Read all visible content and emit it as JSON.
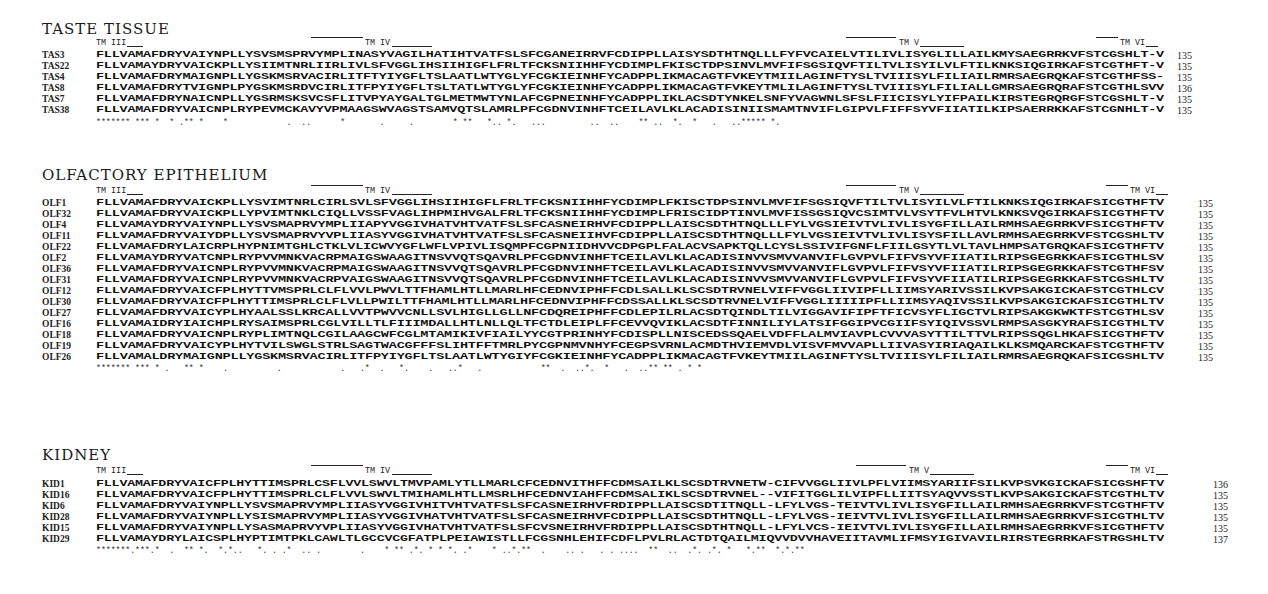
{
  "figure": {
    "sections": [
      {
        "title": "TASTE TISSUE",
        "tm_labels": [
          "TM III",
          "TM IV",
          "TM V",
          "TM VI"
        ],
        "sequences": [
          {
            "name": "TAS3",
            "seq": "FLLVAMAFDRYVAIYNPLLYSVSMSPRVYMPLINASYVAGILHATIHTVATFSLSFCGANEIRRVFCDIPPLLAISYSDTHTNQLLLFYFVCAIELVTILIVLISYGLILLAILKMYSAEGRRKVFSTCGSHLT-V",
            "length": "135"
          },
          {
            "name": "TAS22",
            "seq": "FLLVAMAYDRYVAICKPLLYSIIMTNRLIIRLIVLSFVGGLIHSIIHIGFLFRLTFCKSNIIHHFYCDIMPLFKISCTDPSINVLMVFIFSGSIQVFTILTVLISYILVLFTILKNKSIQGIRKAFSTCGTHFT-V",
            "length": "135"
          },
          {
            "name": "TAS4",
            "seq": "FLLVAMAFDRYMAIGNPLLYGSKMSRVACIRLITFTYIYGFLTSLAATLWTYGLYFCGKIEINHFYCADPPLIKMACAGTFVKEYTMIILAGINFTYSLTVIIISYLFILIAILRMRSAEGRQKAFSTCGTHFSS-",
            "length": "135"
          },
          {
            "name": "TAS8",
            "seq": "FLLVAMAFDRYTVIGNPLPYGSKMSRDVCIRLITFPYIYGFLTSLTATLWTYGLYFCGKIEINHFYCADPPLIKMACAGTFVKEYTMLILAGINFTYSLTVIIISYLFILIALLGMRSAEGRQRAFSTCGTHLSVV",
            "length": "136"
          },
          {
            "name": "TAS7",
            "seq": "FLLVAMAFDRYNAICNPLLYGSRMSKSVCSFLITVPYAYGALTGLMETMWTYNLAFCGPNEINHFYCADPPLIKLACSDTYNKELSNFYVAGWNLSFSLFIICISYLYIFPAILKIRSTEGRQRGFSTCGSHLT-V",
            "length": "135"
          },
          {
            "name": "TAS38",
            "seq": "FLLVAMAFDRYVAICNPLRYPEVMCKAVYVPMAAGSWVAGSTSAMVQTSLAMRLPFCGDNVINHFTCEILAVLKLACADISINIISMAMTNVIFLGIPVLFIFFSYVFIIATILKIPSAERRKKAFSTCGNHLT-V",
            "length": "135"
          }
        ],
        "consensus": "******* *** *  * .** *    *            .  ..      *       .     .        * **   *.. *.   ...         ..  ..    ** ..  *.  *   .   ..***** *."
      },
      {
        "title": "OLFACTORY EPITHELIUM",
        "tm_labels": [
          "TM III",
          "TM IV",
          "TM V",
          "TM VI"
        ],
        "sequences": [
          {
            "name": "OLF1",
            "seq": "FLLVAMAFDRYVAICKPLLYSVIMTNRLCIRLSVLSFVGGLIHSIIHIGFLFRLTFCKSNIIHHFYCDIMPLFKISCTDPSINVLMVFIFSGSIQVFTILTVLISYILVLFTILKNKSIQGIRKAFSICGTHFTV",
            "length": "135"
          },
          {
            "name": "OLF32",
            "seq": "FLLVAMAFDRYVAICKPLLYPVIMTNKLCIQLLVSSFVAGLIHPMIHVGALFRLTFCKSNIIHHFYCDIMPLFRISCIDPTINVLMVFISSGSIQVCSIMTVLVSYTFVLHTVLKNKSVQGIRKAFSICGTHFTV",
            "length": "135"
          },
          {
            "name": "OLF4",
            "seq": "FLLVAMAYDRYVAIYNPLLYSVSMAPRVYMPLIIAPYVGGIVHATVHTVATFSLSFCASNEIRHVFCDIPPLLAISCSDTHTNQLLLFYLVGSIEIVTVLIVLISYGFILLAILRMHSAEGRRKVFSICGTHFTV",
            "length": "135"
          },
          {
            "name": "OLF11",
            "seq": "FLLVAMAFDRYVAIYDPLLYSVSMAPRVYVPLIIASYVGGIVHATVHTVATFSLSFCASNEIIHVFCDIPPLLAISCSDTHTNQLLLFYLVGSIEIVTVLIVLISYSFILLAVLRMHSAEGRRKVFSTCGSHLTV",
            "length": "135"
          },
          {
            "name": "OLF22",
            "seq": "FLLVAMAFDRYLAICRPLHYPNIMTGHLCTKLVLICWVYGFLWFLVPIVLISQMPFCGPNIIDHVVCDPGPLFALACVSAPKTQLLCYSLSSIVIFGNFLFIILGSYTLVLTAVLHMPSATGRQKAFSICGTHFTV",
            "length": "135"
          },
          {
            "name": "OLF2",
            "seq": "FLLVAMAYDRYVATCNPLRYPVVMNKVACRPMAIGSWAAGITNSVVQTSQAVRLPFCGDNVINHFTCEILAVLKLACADISINVVSMVVANVIFLGVPVLFIFVSYVFIIATILRIPSGEGRKKAFSICGTHLSV",
            "length": "135"
          },
          {
            "name": "OLF36",
            "seq": "FLLVAMAFDRYVAICNPLRYPVVMNKVACRPMAIGSWAAGITNSVVQTSQAVRLPFCGDNVINHFTCEILAVLKLACADISINVVSMVVANVIFLGVPVLFIFVSYVFIIATILRIPSGEGRKKAFSTCGTHFSV",
            "length": "135"
          },
          {
            "name": "OLF31",
            "seq": "FLLVAMAFDRYVAICNPLRYPVVMNKVACRPVAIGSWAAGITNSVVQTSQAVRLPFCGDNVINHFTCEILAVLKLACADISINVVSMVVANVIFLGVPVLFIFVSYVFIIATILRIPSGEGRKKAFSTCGSHLTV",
            "length": "135"
          },
          {
            "name": "OLF12",
            "seq": "FLLVAMAFDRYVAICFPLHYTTVMSPRLCLFLVVLPWVLTTFHAMLHTLLMARLHFCEDNVIPHFFCDLSALLKLSCSDTRVNELVIFFVGGLIIVIPFLLIIMSYARIVSSILKVPSAKGICKAFSTCGTHLCV",
            "length": "135"
          },
          {
            "name": "OLF30",
            "seq": "FLLVAMAFDRYVAICFPLHYTTIMSPRLCLFLVLLPWILTTFHAMLHTLLMARLHFCEDNVIPHFFCDSSALLKLSCSDTRVNELVIFFVGGLIIIIIPFLLIIMSYAQIVSSILKVPSAKGICKAFSICGTHLTV",
            "length": "135"
          },
          {
            "name": "OLF27",
            "seq": "FLLVAMAFDRYVAICYPLHYAALSSLKRCALLVVTPWVVCNLLSVLHIGLLGLLNFCDQREIPHFFCDLEPILRLACSDTQINDLTILVIGGAVIFIPFTFICVSYFLIGCTVLRIPSAKGKWKTFSTCGTHLSV",
            "length": "135"
          },
          {
            "name": "OLF16",
            "seq": "FLLVAMAIDRYIAICHPLRYSAIMSPRLCGLVILLTLFIIIMDALLHTLNLLQLTFCTDLEIPLFFCEVVQVIKLACSDTFINNILIYLATSIFGGIPVCGIIFSYIQIVSSVLRMPSASGKYRAFSICGTHLTV",
            "length": "135"
          },
          {
            "name": "OLF18",
            "seq": "FLLVAMAFDRYVAICNPLRYPLIMTNQLCGILAAGCWFCGLMTAMIKIVFIAILYYCGTPRINHYFCDISPLLNISCEDSSQAELVDFFLALMVIAVPLCVVVASYTTILTTVLRIPSSQGLHKAFSICGTHFTV",
            "length": "135"
          },
          {
            "name": "OLF19",
            "seq": "FLLVAMAFDRYVAICYPLHYTVILSWGLSTRLSAGTWACGFFFSLIHTFFTMRLPYCGPNMVNHYFCEGPSVRNLACMDTHVIEMVDLVISVFMVVAPLLIIVASYIRIAQAILKLKSMQARCKAFSTCGTHFTV",
            "length": "135"
          },
          {
            "name": "OLF26",
            "seq": "FLLVAMALDRYMAIGNPLLYGSKMSRVACIRLITFPYIYGFLTSLAATLWTYGIYFCGKIEINHFYCADPPLIKMACAGTFVKEYTMIILAGINFTYSLTVIIISYLFILIAILRMRSAEGRQKAFSICGSHLTV",
            "length": "135"
          }
        ],
        "consensus": "******* *** * .   ** *    .          .            .   .*  .   *.    .   ..*   .            **  .  ..*.  *   .  ..** ** . * *"
      },
      {
        "title": "KIDNEY",
        "tm_labels": [
          "TM III",
          "TM IV",
          "TM V",
          "TM VI"
        ],
        "sequences": [
          {
            "name": "KID1",
            "seq": "FLLVAMAFDRYVAICFPLHYTTIMSPRLCSFLVVLSWVLTMVPAMLYTLLMARLCFCEDNVITHFFCDMSAILKLSCSDTRVNETW-CIFVVGGLIIVLPFLVIIMSYARIIFSILKVPSVKGICKAFSICGSHFTV",
            "length": "136"
          },
          {
            "name": "KID16",
            "seq": "FLLVAMAFDRYVAICFPLHYTTIMSPRLCLFLVVLSWVLTMIHAMLHTLLMSRLHFCEDNVIAHFFCDMSALIKLSCSDTRVNEL--VIFITGGLILVIPFLLIITSYAQVVSSTLKVPSAKGICKAFSTCGTHLTV",
            "length": "135"
          },
          {
            "name": "KID6",
            "seq": "FLLVAMAFDRYVAIYNPLLYSVSMAPRVYMPLIIASYVGGIVHITVHTVATFSLSFCASNEIRHVFRDIPPLLAISCSDTITNQLL-LFYLVGS-TEIVTVLIVLISYGFILLAILRMHSAEGRRKVFSTCGTHFTV",
            "length": "135"
          },
          {
            "name": "KID28",
            "seq": "FLLVAMAFDRYVAIYNPLLYSISMAPRVYMPLIIASYVGGIVHATVHTVATFSLSFCASNEIRHVFCDIPPLLAISCSDTHTNQLL-LFYLVGS-IEIVTVLIVLISYGFILLAILRMHSAEGRRKVFSICGTHLTV",
            "length": "135"
          },
          {
            "name": "KID15",
            "seq": "FLLVAMAFDRYVAIYNPLLYSASMAPRVYVPLIIASYVGGIVHATVHTVATFSLSFCVSNEIRHVFRDIPPLLAISCSDTHTNQLL-LFYLVCS-IEIVTVLIVLISYGFILLAILRMHSAEGRRKVFSICGTHFTV",
            "length": "135"
          },
          {
            "name": "KID29",
            "seq": "FLLVAMAYDRYLAICSPLHYPTIMTPKLCAWLTLGCCVCGFATPLPEIAWISTLLFCGSNHLEHIFCDFLPVLRLACTDTQAILMIQVVDVVHAVEIITAVMLIFMSYIGIVAVILRIRSTEGRRKAFSTRGSHLTV",
            "length": "137"
          }
        ],
        "consensus": "*******.***.*  .  ** *.  *.*..   *. . .*  .. .        .    * ** .*. * * *. .*    * ..*.**  .    .. .   . . ....  **  ..  .*. .*. *   *.**  *.*.**"
      }
    ]
  }
}
